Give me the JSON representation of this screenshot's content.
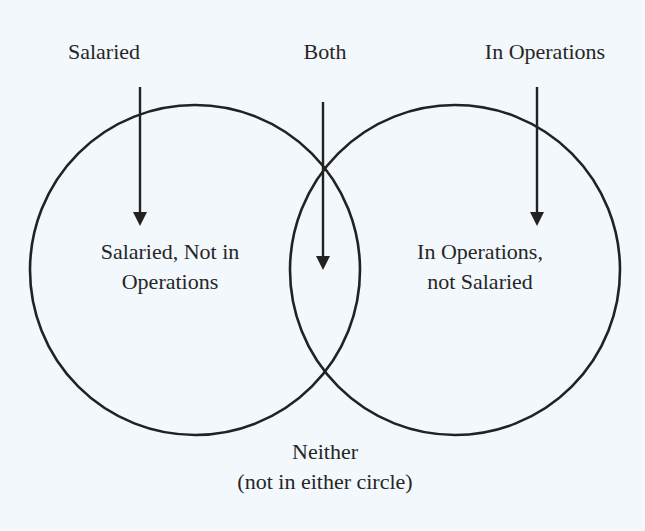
{
  "diagram": {
    "type": "venn",
    "colors": {
      "background": "#f3f8fc",
      "stroke": "#222222",
      "text": "#262626"
    },
    "top_labels": {
      "left": "Salaried",
      "middle": "Both",
      "right": "In Operations"
    },
    "regions": {
      "left_only_line1": "Salaried, Not in",
      "left_only_line2": "Operations",
      "right_only_line1": "In Operations,",
      "right_only_line2": "not Salaried"
    },
    "outside": {
      "line1": "Neither",
      "line2": "(not in either circle)"
    },
    "sets": [
      {
        "name": "Salaried",
        "center": [
          195,
          270
        ],
        "radius": 165
      },
      {
        "name": "In Operations",
        "center": [
          455,
          270
        ],
        "radius": 165
      }
    ]
  }
}
